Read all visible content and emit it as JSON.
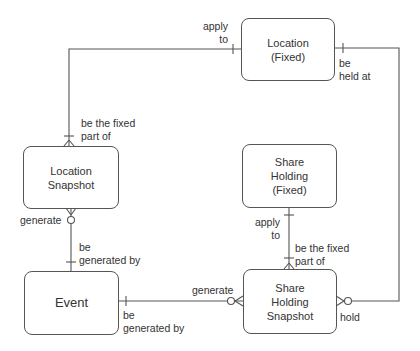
{
  "diagram": {
    "type": "entity-relationship",
    "entities": [
      {
        "id": "location_fixed",
        "label": "Location\n(Fixed)"
      },
      {
        "id": "location_snapshot",
        "label": "Location\nSnapshot"
      },
      {
        "id": "share_holding_fixed",
        "label": "Share\nHolding\n(Fixed)"
      },
      {
        "id": "event",
        "label": "Event"
      },
      {
        "id": "share_holding_snapshot",
        "label": "Share\nHolding\nSnapshot"
      }
    ],
    "relationships": [
      {
        "from": "location_fixed",
        "to": "location_snapshot",
        "from_label": "apply\nto",
        "to_label": "be the fixed\npart of"
      },
      {
        "from": "location_fixed",
        "to": "share_holding_snapshot",
        "from_label": "be\nheld at",
        "to_label": "hold"
      },
      {
        "from": "location_snapshot",
        "to": "event",
        "from_label": "generate",
        "to_label": "be\ngenerated by"
      },
      {
        "from": "share_holding_fixed",
        "to": "share_holding_snapshot",
        "from_label": "apply\nto",
        "to_label": "be the fixed\npart of"
      },
      {
        "from": "event",
        "to": "share_holding_snapshot",
        "from_label": "be\ngenerated by",
        "to_label": "generate"
      }
    ],
    "labels": {
      "lf_ls_apply_to": "apply\nto",
      "ls_be_fixed_part_of": "be the fixed\npart of",
      "lf_be_held_at": "be\nheld at",
      "shs_hold": "hold",
      "ls_generate": "generate",
      "ev_be_generated_by_top": "be\ngenerated by",
      "shf_apply_to": "apply\nto",
      "shs_be_fixed_part_of": "be the fixed\npart of",
      "ev_be_generated_by_right": "be\ngenerated by",
      "shs_generate": "generate"
    },
    "colors": {
      "line": "#555555",
      "text": "#333333",
      "background": "#ffffff"
    }
  }
}
